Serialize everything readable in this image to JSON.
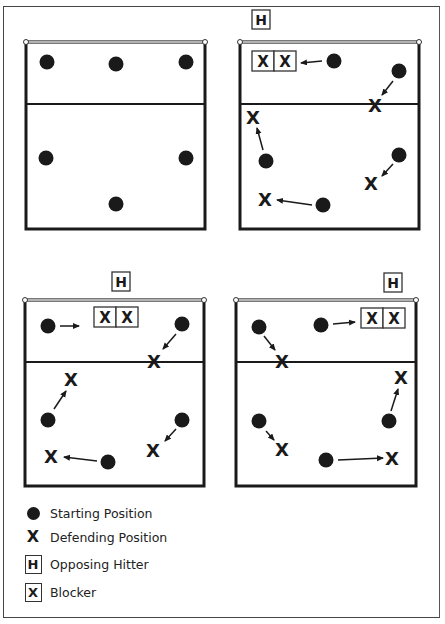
{
  "colors": {
    "ink": "#1a1a1a",
    "line": "#2a2a2a",
    "background": "#ffffff"
  },
  "diagrams": [
    {
      "name": "starting-formation",
      "hitter": null,
      "players": [
        {
          "start": [
            47,
            62
          ]
        },
        {
          "start": [
            116,
            64
          ]
        },
        {
          "start": [
            186,
            62
          ]
        },
        {
          "start": [
            46,
            158
          ]
        },
        {
          "start": [
            186,
            158
          ]
        },
        {
          "start": [
            116,
            204
          ]
        }
      ]
    },
    {
      "name": "hitter-left-front",
      "hitter": {
        "label": "H",
        "x": 262,
        "y": 19
      },
      "blockers": {
        "label_left": "X",
        "label_right": "X",
        "x": 253,
        "y": 51
      },
      "players": [
        {
          "start": [
            334,
            61
          ],
          "end": [
            296,
            63
          ],
          "arrow_to_block": true
        },
        {
          "start": [
            399,
            71
          ],
          "end": [
            375,
            103
          ],
          "label": "X"
        },
        {
          "start": [
            265,
            161
          ],
          "end": [
            254,
            117
          ],
          "label": "X"
        },
        {
          "start": [
            399,
            155
          ],
          "end": [
            371,
            183
          ],
          "label": "X"
        },
        {
          "start": [
            323,
            205
          ],
          "end": [
            265,
            199
          ],
          "label": "X"
        }
      ]
    },
    {
      "name": "hitter-middle",
      "hitter": {
        "label": "H",
        "x": 112,
        "y": 270
      },
      "blockers": {
        "label_left": "X",
        "label_right": "X",
        "x": 95,
        "y": 307
      },
      "players": [
        {
          "start": [
            48,
            326
          ],
          "end": [
            80,
            326
          ],
          "arrow_to_block": true
        },
        {
          "start": [
            182,
            324
          ],
          "end": [
            155,
            360
          ],
          "label": "X"
        },
        {
          "start": [
            48,
            420
          ],
          "end": [
            70,
            377
          ],
          "label": "X"
        },
        {
          "start": [
            182,
            420
          ],
          "end": [
            154,
            450
          ],
          "label": "X"
        },
        {
          "start": [
            108,
            462
          ],
          "end": [
            51,
            456
          ],
          "label": "X"
        }
      ]
    },
    {
      "name": "hitter-right-front",
      "hitter": {
        "label": "H",
        "x": 384,
        "y": 272
      },
      "blockers": {
        "label_left": "X",
        "label_right": "X",
        "x": 362,
        "y": 308
      },
      "players": [
        {
          "start": [
            321,
            325
          ],
          "end": [
            356,
            322
          ],
          "arrow_to_block": true
        },
        {
          "start": [
            259,
            327
          ],
          "end": [
            281,
            360
          ],
          "label": "X"
        },
        {
          "start": [
            259,
            421
          ],
          "end": [
            282,
            448
          ],
          "label": "X"
        },
        {
          "start": [
            389,
            421
          ],
          "end": [
            401,
            377
          ],
          "label": "X"
        },
        {
          "start": [
            326,
            460
          ],
          "end": [
            390,
            458
          ],
          "label": "X"
        }
      ]
    }
  ],
  "legend": {
    "items": [
      {
        "symbol": "dot",
        "label": "Starting Position"
      },
      {
        "symbol": "X",
        "label": "Defending Position"
      },
      {
        "symbol": "H",
        "label": "Opposing Hitter"
      },
      {
        "symbol": "X-box",
        "label": "Blocker"
      }
    ]
  }
}
